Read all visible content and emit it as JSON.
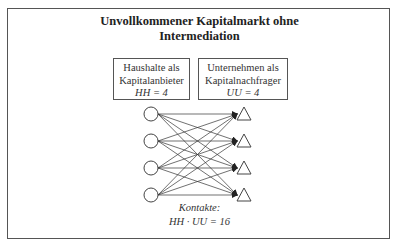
{
  "title": {
    "line1": "Unvollkommener Kapitalmarkt ohne",
    "line2": "Intermediation"
  },
  "households": {
    "line1": "Haushalte als",
    "line2": "Kapitalanbieter",
    "formula": "HH = 4",
    "count": 4,
    "shape": "circle"
  },
  "companies": {
    "line1": "Unternehmen als",
    "line2": "Kapitalnachfrager",
    "formula": "UU = 4",
    "count": 4,
    "shape": "triangle"
  },
  "contacts": {
    "label": "Kontakte:",
    "formula": "HH · UU = 16"
  },
  "colors": {
    "stroke": "#333333",
    "frame": "#555555",
    "background": "#ffffff"
  }
}
